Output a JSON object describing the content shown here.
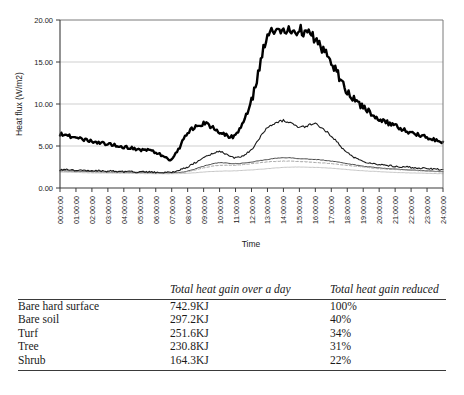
{
  "chart_data": {
    "type": "line",
    "title": "",
    "xlabel": "Time",
    "ylabel": "Heat flux (W/m2)",
    "ylim": [
      0,
      20
    ],
    "yticks": [
      "0.00",
      "5.00",
      "10.00",
      "15.00",
      "20.00"
    ],
    "grid": true,
    "legend_position": "bottom",
    "x": [
      "00:00:00",
      "01:00:00",
      "02:00:00",
      "03:00:00",
      "04:00:00",
      "05:00:00",
      "06:00:00",
      "07:00:00",
      "08:00:00",
      "09:00:00",
      "10:00:00",
      "11:00:00",
      "12:00:00",
      "13:00:00",
      "14:00:00",
      "15:00:00",
      "16:00:00",
      "17:00:00",
      "18:00:00",
      "19:00:00",
      "20:00:00",
      "21:00:00",
      "22:00:00",
      "23:00:00",
      "24:00:00"
    ],
    "series": [
      {
        "name": "Turf",
        "style": "solid-thin-dark",
        "color": "#333333",
        "values": [
          2.05,
          2.0,
          1.95,
          1.9,
          1.88,
          1.85,
          1.8,
          1.8,
          2.0,
          2.6,
          3.0,
          2.9,
          3.1,
          3.4,
          3.6,
          3.5,
          3.4,
          3.2,
          2.9,
          2.6,
          2.4,
          2.25,
          2.15,
          2.05,
          1.95
        ]
      },
      {
        "name": "Tree",
        "style": "dashed-light",
        "color": "#9a9a9a",
        "values": [
          2.0,
          1.95,
          1.9,
          1.85,
          1.82,
          1.8,
          1.78,
          1.78,
          1.95,
          2.4,
          2.7,
          2.7,
          2.9,
          3.1,
          3.2,
          3.15,
          3.05,
          2.9,
          2.7,
          2.5,
          2.3,
          2.2,
          2.1,
          2.0,
          1.92
        ]
      },
      {
        "name": "Shrub",
        "style": "solid-verylight",
        "color": "#c0c0c0",
        "values": [
          1.9,
          1.85,
          1.8,
          1.78,
          1.75,
          1.72,
          1.7,
          1.7,
          1.75,
          1.9,
          2.0,
          2.05,
          2.15,
          2.3,
          2.45,
          2.5,
          2.45,
          2.35,
          2.2,
          2.05,
          1.95,
          1.85,
          1.8,
          1.75,
          1.7
        ]
      },
      {
        "name": "Soil",
        "style": "solid-medium-dark",
        "color": "#1a1a1a",
        "values": [
          2.2,
          2.12,
          2.05,
          2.0,
          1.95,
          1.9,
          1.88,
          1.9,
          2.5,
          3.6,
          4.3,
          3.6,
          4.6,
          7.2,
          8.0,
          7.2,
          7.6,
          6.2,
          4.2,
          3.2,
          2.8,
          2.6,
          2.45,
          2.3,
          2.2
        ]
      },
      {
        "name": "Hard surface",
        "style": "solid-thick-black",
        "color": "#000000",
        "values": [
          6.4,
          6.0,
          5.6,
          5.2,
          4.9,
          4.6,
          4.3,
          3.5,
          6.5,
          7.7,
          6.7,
          6.3,
          10.4,
          18.0,
          18.5,
          18.8,
          17.6,
          15.0,
          11.5,
          9.6,
          8.3,
          7.4,
          6.6,
          6.0,
          5.5
        ]
      }
    ]
  },
  "legend": {
    "items": [
      {
        "label": "Turf"
      },
      {
        "label": "Tree"
      },
      {
        "label": "Shrub"
      },
      {
        "label": "Soil"
      },
      {
        "label": "Hard surface"
      }
    ]
  },
  "table": {
    "headers": [
      "",
      "Total heat gain over a day",
      "Total heat gain reduced"
    ],
    "rows": [
      {
        "name": "Bare hard surface",
        "gain": "742.9KJ",
        "reduced": "100%"
      },
      {
        "name": "Bare soil",
        "gain": "297.2KJ",
        "reduced": "40%"
      },
      {
        "name": "Turf",
        "gain": "251.6KJ",
        "reduced": "34%"
      },
      {
        "name": "Tree",
        "gain": "230.8KJ",
        "reduced": "31%"
      },
      {
        "name": "Shrub",
        "gain": "164.3KJ",
        "reduced": "22%"
      }
    ]
  }
}
